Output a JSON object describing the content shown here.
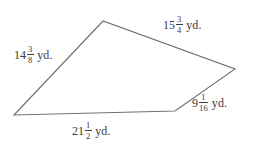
{
  "figure": {
    "name": "quadrilateral-with-side-lengths",
    "background_color": "#ffffff",
    "stroke_color": "#6f6f6f",
    "text_color": "#3b3b3b",
    "unit": "yd.",
    "vertices": [
      {
        "name": "left-vertex",
        "x": 14,
        "y": 115
      },
      {
        "name": "top-vertex",
        "x": 103,
        "y": 21
      },
      {
        "name": "right-vertex",
        "x": 235,
        "y": 69
      },
      {
        "name": "bottom-right-vertex",
        "x": 175,
        "y": 111
      }
    ],
    "polygon_points": "14,115 103,21 235,69 175,111",
    "sides": [
      {
        "name": "left-side",
        "position": "upper-left",
        "whole": "14",
        "numerator": "3",
        "denominator": "8",
        "unit": "yd.",
        "full_text": "14 3/8 yd."
      },
      {
        "name": "top-side",
        "position": "upper-right",
        "whole": "15",
        "numerator": "3",
        "denominator": "4",
        "unit": "yd.",
        "full_text": "15 3/4 yd."
      },
      {
        "name": "right-side",
        "position": "lower-right",
        "whole": "9",
        "numerator": "1",
        "denominator": "16",
        "unit": "yd.",
        "full_text": "9 1/16 yd."
      },
      {
        "name": "bottom-side",
        "position": "bottom",
        "whole": "21",
        "numerator": "1",
        "denominator": "2",
        "unit": "yd.",
        "full_text": "21 1/2 yd."
      }
    ]
  }
}
